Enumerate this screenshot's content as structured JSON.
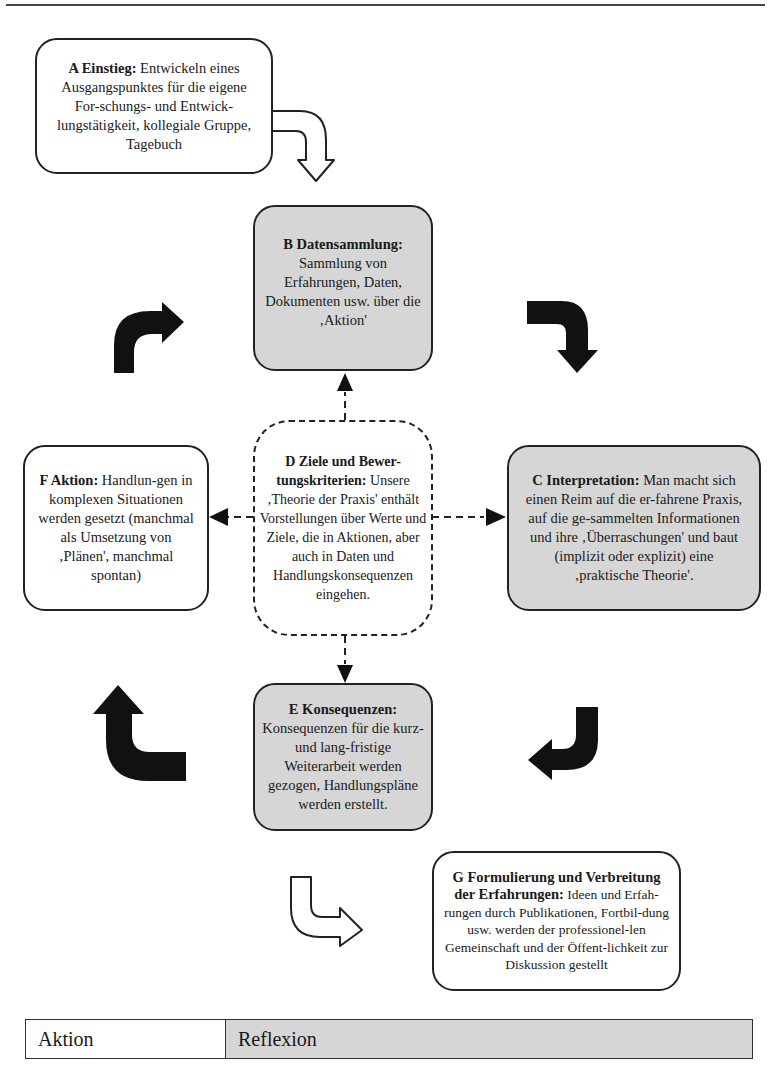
{
  "diagram": {
    "nodes": {
      "A": {
        "title": "A Einstieg:",
        "body": " Entwickeln eines Ausgangspunktes für die eigene For-schungs- und Entwick-lungstätigkeit, kollegiale Gruppe, Tagebuch"
      },
      "B": {
        "title": "B Datensammlung:",
        "body": " Sammlung von Erfahrungen, Daten, Dokumenten usw. über die ‚Aktion'"
      },
      "C": {
        "title": "C Interpretation:",
        "body": " Man macht sich einen Reim auf die er-fahrene Praxis, auf die ge-sammelten Informationen und ihre ‚Überraschungen' und baut (implizit oder explizit) eine ‚praktische Theorie'."
      },
      "D": {
        "title": "D Ziele und Bewer-tungskriterien:",
        "body": " Unsere ‚Theorie der Praxis' enthält Vorstellungen über Werte und Ziele, die in Aktionen, aber auch in Daten und Handlungskonsequenzen eingehen."
      },
      "E": {
        "title": "E Konsequenzen:",
        "body": " Konsequenzen für die kurz- und lang-fristige Weiterarbeit werden gezogen, Handlungspläne werden erstellt."
      },
      "F": {
        "title": "F Aktion:",
        "body": " Handlun-gen in komplexen Situationen werden gesetzt (manchmal als Umsetzung von ‚Plänen', manchmal spontan)"
      },
      "G": {
        "title": "G Formulierung und Verbreitung der Erfahrungen:",
        "body": " Ideen und Erfah-rungen durch Publikationen, Fortbil-dung usw. werden der professionel-len Gemeinschaft und der Öffent-lichkeit zur Diskussion gestellt"
      }
    },
    "arrows": [
      {
        "from": "A",
        "to": "B",
        "style": "hollow-curved"
      },
      {
        "from": "B",
        "to": "C",
        "style": "solid-curved"
      },
      {
        "from": "C",
        "to": "E",
        "style": "solid-curved"
      },
      {
        "from": "E",
        "to": "F",
        "style": "solid-curved"
      },
      {
        "from": "F",
        "to": "B",
        "style": "solid-curved"
      },
      {
        "from": "E",
        "to": "G",
        "style": "hollow-curved"
      },
      {
        "from": "D",
        "to": "B",
        "style": "dashed"
      },
      {
        "from": "D",
        "to": "C",
        "style": "dashed"
      },
      {
        "from": "D",
        "to": "E",
        "style": "dashed"
      },
      {
        "from": "D",
        "to": "F",
        "style": "dashed"
      }
    ]
  },
  "legend": {
    "left_label": "Aktion",
    "right_label": "Reflexion"
  },
  "colors": {
    "reflexion_fill": "#d6d6d6",
    "aktion_fill": "#ffffff",
    "stroke": "#222222"
  }
}
